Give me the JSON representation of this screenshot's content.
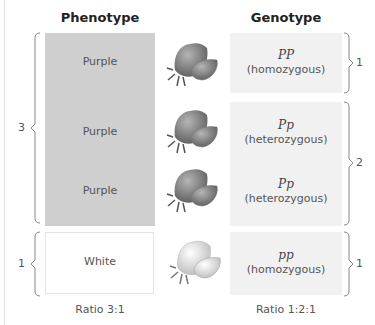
{
  "headers": {
    "phenotype": "Phenotype",
    "genotype": "Genotype"
  },
  "phenotype": {
    "rows": [
      {
        "label": "Purple"
      },
      {
        "label": "Purple"
      },
      {
        "label": "Purple"
      },
      {
        "label": "White"
      }
    ],
    "brackets": [
      {
        "count": "3"
      },
      {
        "count": "1"
      }
    ],
    "ratio": "Ratio 3:1"
  },
  "genotype": {
    "rows": [
      {
        "symbol": "PP",
        "desc": "(homozygous)"
      },
      {
        "symbol": "Pp",
        "desc": "(heterozygous)"
      },
      {
        "symbol": "Pp",
        "desc": "(heterozygous)"
      },
      {
        "symbol": "pp",
        "desc": "(homozygous)"
      }
    ],
    "brackets": [
      {
        "count": "1"
      },
      {
        "count": "2"
      },
      {
        "count": "1"
      }
    ],
    "ratio": "Ratio 1:2:1"
  },
  "flowers": [
    {
      "icon": "purple-flower-icon"
    },
    {
      "icon": "purple-flower-icon"
    },
    {
      "icon": "purple-flower-icon"
    },
    {
      "icon": "white-flower-icon"
    }
  ],
  "colors": {
    "purple_box": "#cfcfcf",
    "genotype_box": "#f1f1f1",
    "bracket": "#888888"
  }
}
